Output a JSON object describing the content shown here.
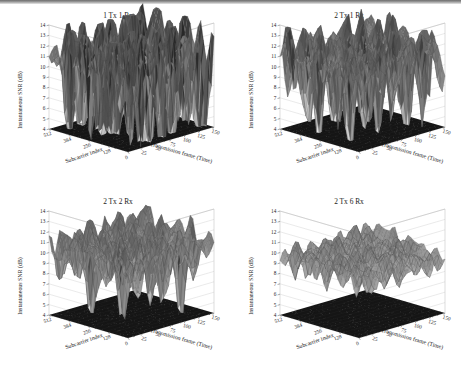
{
  "figure": {
    "background_color": "#ffffff",
    "panel_count": 4,
    "scan_artifact": "top-edge-dark-band"
  },
  "chart_data": [
    {
      "type": "surface",
      "panel_index": 0,
      "title": "1 Tx 1 Rx",
      "xlabel": "Subcarrier index",
      "ylabel": "Transmission frame (Time)",
      "zlabel": "Instantaneous SNR (dB)",
      "xticks": [
        0,
        128,
        256,
        384,
        512
      ],
      "yticks": [
        25,
        50,
        75,
        100,
        125,
        150
      ],
      "zticks": [
        4,
        5,
        6,
        7,
        8,
        9,
        10,
        11,
        12,
        13,
        14
      ],
      "xlim": [
        0,
        512
      ],
      "ylim": [
        0,
        150
      ],
      "zlim": [
        4,
        14
      ],
      "grid": true,
      "colormap": "gray",
      "floor_contour": true,
      "mean_snr_db": 10.5,
      "fade_depth_db": 7.0,
      "surface_roughness": 1.0,
      "diversity_order": 1,
      "description": "Single antenna link: deepest fades, SNR swings from about 4 dB to 14 dB with sharp spiky nulls."
    },
    {
      "type": "surface",
      "panel_index": 1,
      "title": "2 Tx 1 Rx",
      "xlabel": "Subcarrier index",
      "ylabel": "Transmission frame (Time)",
      "zlabel": "Instantaneous SNR (dB)",
      "xticks": [
        0,
        128,
        256,
        384,
        512
      ],
      "yticks": [
        25,
        50,
        75,
        100,
        125,
        150
      ],
      "zticks": [
        4,
        5,
        6,
        7,
        8,
        9,
        10,
        11,
        12,
        13,
        14
      ],
      "xlim": [
        0,
        512
      ],
      "ylim": [
        0,
        150
      ],
      "zlim": [
        4,
        14
      ],
      "grid": true,
      "colormap": "gray",
      "floor_contour": true,
      "mean_snr_db": 10.6,
      "fade_depth_db": 4.6,
      "surface_roughness": 0.72,
      "diversity_order": 2,
      "description": "Two transmit antennas, one receive: fades shallower than SISO, SNR mostly between 6.5 and 13.5 dB."
    },
    {
      "type": "surface",
      "panel_index": 2,
      "title": "2 Tx 2 Rx",
      "xlabel": "Subcarrier index",
      "ylabel": "Transmission frame (Time)",
      "zlabel": "Instantaneous SNR (dB)",
      "xticks": [
        0,
        128,
        256,
        384,
        512
      ],
      "yticks": [
        25,
        50,
        75,
        100,
        125,
        150
      ],
      "zticks": [
        4,
        5,
        6,
        7,
        8,
        9,
        10,
        11,
        12,
        13,
        14
      ],
      "xlim": [
        0,
        512
      ],
      "ylim": [
        0,
        150
      ],
      "zlim": [
        4,
        14
      ],
      "grid": true,
      "colormap": "gray",
      "floor_contour": true,
      "mean_snr_db": 10.3,
      "fade_depth_db": 3.2,
      "surface_roughness": 0.5,
      "diversity_order": 4,
      "description": "Two by two MIMO: smoother surface, SNR largely confined between 7.5 and 13 dB."
    },
    {
      "type": "surface",
      "panel_index": 3,
      "title": "2 Tx 6 Rx",
      "xlabel": "Subcarrier index",
      "ylabel": "Transmission frame (Time)",
      "zlabel": "Instantaneous SNR (dB)",
      "xticks": [
        0,
        128,
        256,
        384,
        512
      ],
      "yticks": [
        25,
        50,
        75,
        100,
        125,
        150
      ],
      "zticks": [
        4,
        5,
        6,
        7,
        8,
        9,
        10,
        11,
        12,
        13,
        14
      ],
      "xlim": [
        0,
        512
      ],
      "ylim": [
        0,
        150
      ],
      "zlim": [
        4,
        14
      ],
      "grid": true,
      "colormap": "gray",
      "floor_contour": true,
      "mean_snr_db": 9.6,
      "fade_depth_db": 2.1,
      "surface_roughness": 0.34,
      "diversity_order": 12,
      "description": "Two by six MIMO: highest diversity order, flattest surface, SNR hardening around 8 to 11.5 dB."
    }
  ]
}
